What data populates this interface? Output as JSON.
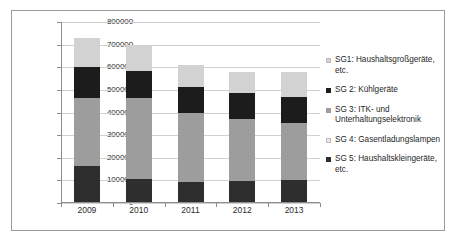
{
  "chart_data": {
    "type": "bar",
    "subtype": "stacked-column",
    "title": "",
    "subtitle": "",
    "xlabel": "",
    "ylabel": "",
    "categories": [
      "2009",
      "2010",
      "2011",
      "2012",
      "2013"
    ],
    "ylim": [
      0,
      800000
    ],
    "ytick_values": [
      0,
      100000,
      200000,
      300000,
      400000,
      500000,
      600000,
      700000,
      800000
    ],
    "ytick_labels": [
      "0",
      "100000",
      "200000",
      "300000",
      "400000",
      "500000",
      "600000",
      "700000",
      "800000"
    ],
    "grid": true,
    "grid_axis": "y",
    "legend_position": "right",
    "stack_order_bottom_to_top": [
      "SG 5",
      "SG 4",
      "SG 3",
      "SG 2",
      "SG1"
    ],
    "series": [
      {
        "name": "SG1",
        "legend_label": "SG1: Haushaltsgroßgeräte, etc.",
        "color": "#d2d2d2",
        "values": [
          130000,
          110000,
          97000,
          93000,
          110000
        ]
      },
      {
        "name": "SG 2",
        "legend_label": "SG 2: Kühlgeräte",
        "color": "#1c1c1c",
        "values": [
          135000,
          120000,
          117000,
          114000,
          115000
        ]
      },
      {
        "name": "SG 3",
        "legend_label": "SG 3: ITK- und Unterhaltungselektronik",
        "color": "#9d9d9d",
        "values": [
          300000,
          360000,
          305000,
          277000,
          250000
        ]
      },
      {
        "name": "SG 4",
        "legend_label": "SG 4: Gasentladungslampen",
        "color": "#e8e8e8",
        "values": [
          0,
          0,
          0,
          0,
          0
        ]
      },
      {
        "name": "SG 5",
        "legend_label": "SG 5: Haushaltskleingeräte, etc.",
        "color": "#2e2e2e",
        "values": [
          160000,
          100000,
          88000,
          92000,
          98000
        ]
      }
    ],
    "totals": [
      725000,
      690000,
      607000,
      576000,
      573000
    ]
  },
  "legend": {
    "items": [
      {
        "label": "SG1: Haushaltsgroßgeräte,\netc.",
        "color": "#d2d2d2"
      },
      {
        "label": "SG 2: Kühlgeräte",
        "color": "#1c1c1c"
      },
      {
        "label": "SG 3: ITK- und\nUnterhaltungselektronik",
        "color": "#9d9d9d"
      },
      {
        "label": "SG 4: Gasentladungslampen",
        "color": "#e8e8e8"
      },
      {
        "label": "SG 5: Haushaltskleingeräte,\netc.",
        "color": "#2e2e2e"
      }
    ]
  }
}
